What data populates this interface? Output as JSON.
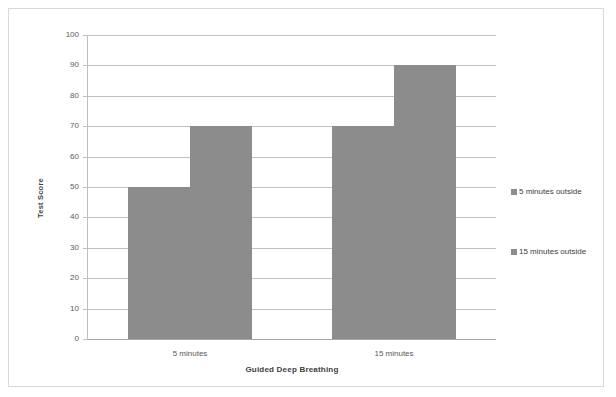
{
  "chart_data": {
    "type": "bar",
    "title": "",
    "xlabel": "Guided Deep Breathing",
    "ylabel": "Test Score",
    "categories": [
      "5 minutes",
      "15 minutes"
    ],
    "series": [
      {
        "name": "5 minutes outside",
        "values": [
          50,
          70
        ],
        "color": "#8c8c8c"
      },
      {
        "name": "15 minutes outside",
        "values": [
          70,
          90
        ],
        "color": "#8c8c8c"
      }
    ],
    "ylim": [
      0,
      100
    ],
    "ytick_step": 10,
    "yticks": [
      100,
      90,
      80,
      70,
      60,
      50,
      40,
      30,
      20,
      10,
      0
    ],
    "ytick_labels": [
      "100",
      "90",
      "80",
      "70",
      "60",
      "50",
      "40",
      "30",
      "20",
      "10",
      "0"
    ],
    "grid": true,
    "grid_axis": "y",
    "legend_position": "right",
    "bar_gap_within_group": 0,
    "border_color": "#d9d9d9",
    "gridline_color": "#bfbfbf",
    "background": "#ffffff"
  }
}
